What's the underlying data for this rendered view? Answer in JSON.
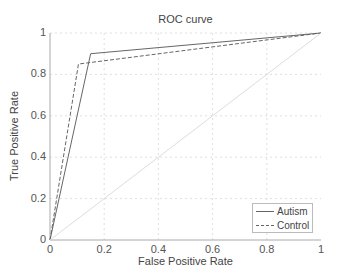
{
  "chart_data": {
    "type": "line",
    "title": "ROC curve",
    "xlabel": "False Positive Rate",
    "ylabel": "True Positive Rate",
    "xlim": [
      0,
      1
    ],
    "ylim": [
      0,
      1
    ],
    "xticks": [
      "0",
      "0.2",
      "0.4",
      "0.6",
      "0.8",
      "1"
    ],
    "yticks": [
      "0",
      "0.2",
      "0.4",
      "0.6",
      "0.8",
      "1"
    ],
    "grid": true,
    "legend_position": "lower right",
    "series": [
      {
        "name": "Autism",
        "style": "solid",
        "x": [
          0,
          0.15,
          1
        ],
        "y": [
          0,
          0.9,
          1
        ]
      },
      {
        "name": "Control",
        "style": "dashed",
        "x": [
          0,
          0.105,
          1
        ],
        "y": [
          0,
          0.85,
          1
        ]
      },
      {
        "name": "chance",
        "style": "solid-light",
        "x": [
          0,
          1
        ],
        "y": [
          0,
          1
        ]
      }
    ]
  },
  "legend": {
    "items": [
      {
        "label": "Autism"
      },
      {
        "label": "Control"
      }
    ]
  },
  "colors": {
    "series": "#666666",
    "diagonal": "#dddddd",
    "grid": "#d8d8d8",
    "axis": "#aaaaaa"
  }
}
